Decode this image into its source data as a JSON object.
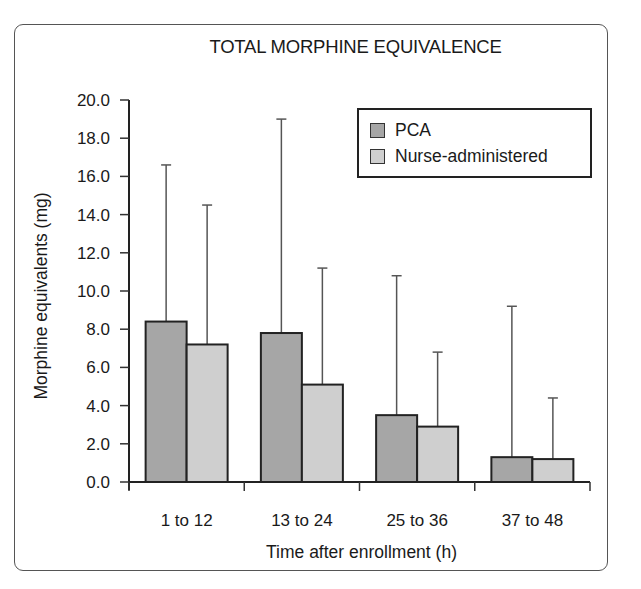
{
  "chart_data": {
    "type": "bar",
    "title": "TOTAL MORPHINE EQUIVALENCE",
    "xlabel": "Time after enrollment (h)",
    "ylabel": "Morphine equivalents (mg)",
    "ylim": [
      0,
      20
    ],
    "yticks": [
      "0.0",
      "2.0",
      "4.0",
      "6.0",
      "8.0",
      "10.0",
      "12.0",
      "14.0",
      "16.0",
      "18.0",
      "20.0"
    ],
    "categories": [
      "1 to 12",
      "13 to 24",
      "25 to 36",
      "37 to 48"
    ],
    "series": [
      {
        "name": "PCA",
        "color": "#a6a6a6",
        "values": [
          8.4,
          7.8,
          3.5,
          1.3
        ],
        "error_upper": [
          16.6,
          19.0,
          10.8,
          9.2
        ]
      },
      {
        "name": "Nurse-administered",
        "color": "#cfcfcf",
        "values": [
          7.2,
          5.1,
          2.9,
          1.2
        ],
        "error_upper": [
          14.5,
          11.2,
          6.8,
          4.4
        ]
      }
    ],
    "grid": false,
    "legend_position": "upper right"
  }
}
